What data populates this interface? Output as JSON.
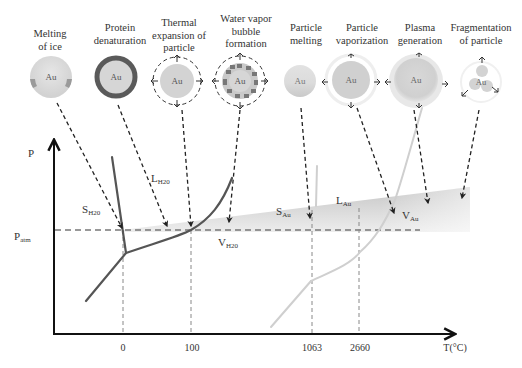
{
  "processes": [
    {
      "id": "melting-of-ice",
      "line1": "Melting",
      "line2": "of ice",
      "line3": "",
      "particle_label": "Au"
    },
    {
      "id": "protein-denaturation",
      "line1": "Protein",
      "line2": "denaturation",
      "line3": "",
      "particle_label": "Au"
    },
    {
      "id": "thermal-expansion",
      "line1": "Thermal",
      "line2": "expansion of",
      "line3": "particle",
      "particle_label": "Au"
    },
    {
      "id": "water-vapor-bubble",
      "line1": "Water vapor",
      "line2": "bubble",
      "line3": "formation",
      "particle_label": "Au"
    },
    {
      "id": "particle-melting",
      "line1": "Particle",
      "line2": "melting",
      "line3": "",
      "particle_label": "Au"
    },
    {
      "id": "particle-vaporization",
      "line1": "Particle",
      "line2": "vaporization",
      "line3": "",
      "particle_label": "Au"
    },
    {
      "id": "plasma-generation",
      "line1": "Plasma",
      "line2": "generation",
      "line3": "",
      "particle_label": "Au"
    },
    {
      "id": "fragmentation",
      "line1": "Fragmentation",
      "line2": "of particle",
      "line3": "",
      "particle_label": "Au"
    }
  ],
  "axes": {
    "y_label": "P",
    "p_atm_main": "P",
    "p_atm_sub": "atm",
    "x_label": "T(°C)",
    "x_ticks": [
      "0",
      "100",
      "1063",
      "2660"
    ]
  },
  "regions": {
    "s_h2o": {
      "main": "S",
      "sub": "H20"
    },
    "l_h2o": {
      "main": "L",
      "sub": "H20"
    },
    "v_h2o": {
      "main": "V",
      "sub": "H20"
    },
    "s_au": {
      "main": "S",
      "sub": "Au"
    },
    "l_au": {
      "main": "L",
      "sub": "Au"
    },
    "v_au": {
      "main": "V",
      "sub": "Au"
    }
  },
  "colors": {
    "water_curve": "#555555",
    "gold_curve": "#cfcfcf",
    "particle_fill": "#d3d3d3",
    "shaded_region": "#c8c8c8",
    "axis": "#111111"
  }
}
